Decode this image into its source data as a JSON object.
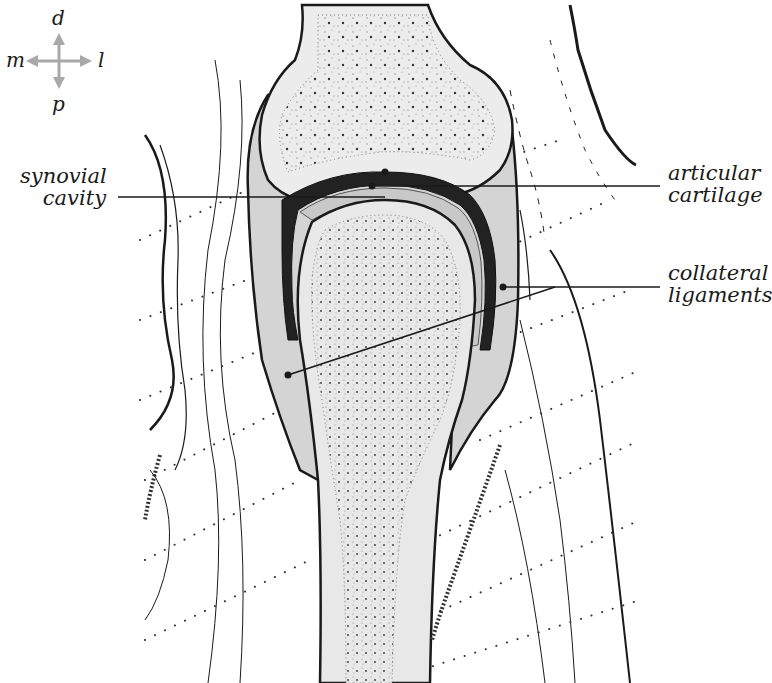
{
  "diagram": {
    "type": "anatomical-cross-section",
    "colors": {
      "background": "#ffffff",
      "ink": "#1a1a1a",
      "bone_fill": "#ececec",
      "capsule_fill": "#d4d4d4",
      "cartilage_fill": "#c8c8c8",
      "compass_arrows": "#a8a8a8"
    }
  },
  "compass": {
    "up": "d",
    "down": "p",
    "left": "m",
    "right": "l"
  },
  "labels": {
    "synovial_cavity": {
      "line1": "synovial",
      "line2": "cavity"
    },
    "articular_cartilage": {
      "line1": "articular",
      "line2": "cartilage"
    },
    "collateral_ligaments": {
      "line1": "collateral",
      "line2": "ligaments"
    }
  }
}
